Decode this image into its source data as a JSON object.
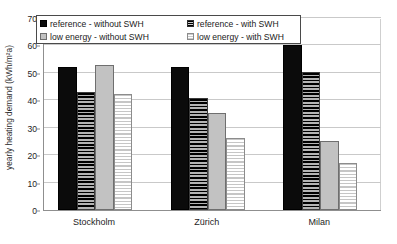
{
  "chart_data": {
    "type": "bar",
    "title": "",
    "xlabel": "",
    "ylabel": "yearly heating demand (kWh/m²a)",
    "ylim": [
      0,
      70
    ],
    "ytick_step": 10,
    "yticks": [
      "0",
      "10",
      "20",
      "30",
      "40",
      "50",
      "60",
      "70"
    ],
    "grid": "horizontal",
    "legend_position": "top-left-overlay",
    "categories": [
      "Stockholm",
      "Zürich",
      "Milan"
    ],
    "series": [
      {
        "name": "reference - without SWH",
        "pattern": "solid-black",
        "color": "#0b0b0b",
        "values": [
          52,
          52,
          60
        ]
      },
      {
        "name": "reference - with SWH",
        "pattern": "horizontal-hatch-dark",
        "color": "#8e8e8e",
        "values": [
          43,
          41,
          50.5
        ]
      },
      {
        "name": "low energy - without SWH",
        "pattern": "solid-light-gray",
        "color": "#c2c2c2",
        "values": [
          53,
          35.5,
          25
        ]
      },
      {
        "name": "low energy - with SWH",
        "pattern": "horizontal-hatch-light",
        "color": "#ffffff",
        "values": [
          42.3,
          26.2,
          17.3
        ]
      }
    ]
  },
  "legend": {
    "entries": [
      {
        "label": "reference - without SWH"
      },
      {
        "label": "reference - with SWH"
      },
      {
        "label": "low energy - without SWH"
      },
      {
        "label": "low energy - with SWH"
      }
    ]
  },
  "axis": {
    "y_title": "yearly heating demand (kWh/m²a)"
  }
}
